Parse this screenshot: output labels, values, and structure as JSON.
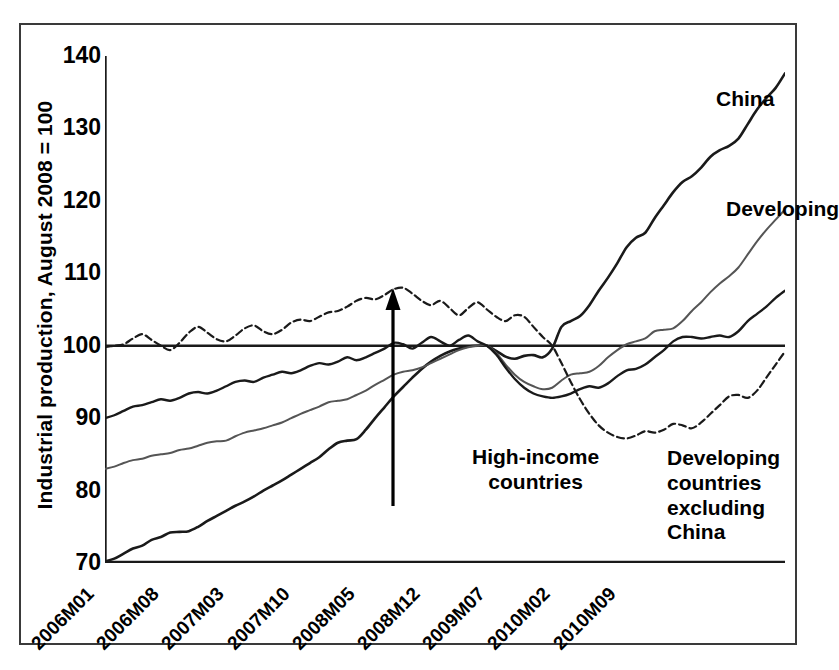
{
  "chart_data": {
    "type": "line",
    "title": "",
    "subtitle": "",
    "xlabel": "",
    "ylabel": "Industrial production, August 2008 = 100",
    "ylim": [
      70,
      140
    ],
    "ytick_values": [
      70,
      80,
      90,
      100,
      110,
      120,
      130,
      140
    ],
    "ytick_labels": [
      "70",
      "80",
      "90",
      "100",
      "110",
      "120",
      "130",
      "140"
    ],
    "grid": false,
    "legend_position": "inline-annotations",
    "reference_line": 100,
    "x_tick_labels": [
      "2006M01",
      "2006M08",
      "2007M03",
      "2007M10",
      "2008M05",
      "2008M12",
      "2009M07",
      "2010M02",
      "2010M09"
    ],
    "x_tick_indices": [
      0,
      7,
      14,
      21,
      28,
      35,
      42,
      49,
      56
    ],
    "x_count": 61,
    "annotations": [
      {
        "name": "china",
        "text": "China"
      },
      {
        "name": "developing",
        "text": "Developing"
      },
      {
        "name": "high-income",
        "text": "High-income\ncountries"
      },
      {
        "name": "developing-excluding-china",
        "text": "Developing\ncountries\nexcluding\nChina"
      }
    ],
    "series": [
      {
        "name": "China",
        "style": "solid",
        "color": "#1a1a1a",
        "width": 2.6,
        "values": [
          70.2,
          70.6,
          71.3,
          72.0,
          72.4,
          73.2,
          73.6,
          74.2,
          74.3,
          74.4,
          75.0,
          75.8,
          76.5,
          77.2,
          77.9,
          78.5,
          79.2,
          80.0,
          80.7,
          81.4,
          82.2,
          83.0,
          83.8,
          84.6,
          85.7,
          86.6,
          86.9,
          87.1,
          88.4,
          90.0,
          91.5,
          93.0,
          94.3,
          95.6,
          96.8,
          97.8,
          98.6,
          99.2,
          99.6,
          99.9,
          100.0,
          100.0,
          99.3,
          98.5,
          98.2,
          98.6,
          98.7,
          98.4,
          99.6,
          102.6,
          103.4,
          104.1,
          105.6,
          107.6,
          109.4,
          111.4,
          113.6,
          114.9,
          115.6,
          117.6,
          119.4,
          121.2,
          122.6,
          123.4,
          124.6,
          126.1,
          127.0,
          127.6,
          128.6,
          130.6,
          132.6,
          134.2,
          135.6,
          137.6
        ],
        "end_value": 137.6,
        "start_value": 70.2
      },
      {
        "name": "Developing",
        "style": "solid-thin",
        "color": "#555555",
        "width": 2.0,
        "values": [
          83.0,
          83.3,
          83.8,
          84.2,
          84.4,
          84.8,
          85.0,
          85.2,
          85.6,
          85.8,
          86.2,
          86.6,
          86.8,
          86.9,
          87.5,
          88.0,
          88.3,
          88.6,
          89.0,
          89.4,
          90.0,
          90.6,
          91.1,
          91.6,
          92.2,
          92.4,
          92.6,
          93.2,
          93.8,
          94.6,
          95.3,
          96.0,
          96.4,
          96.6,
          97.0,
          97.6,
          98.2,
          98.8,
          99.4,
          99.8,
          100.0,
          100.0,
          99.0,
          97.4,
          96.0,
          95.0,
          94.4,
          94.0,
          94.2,
          95.2,
          96.0,
          96.2,
          96.4,
          97.2,
          98.4,
          99.4,
          100.2,
          100.6,
          101.0,
          102.0,
          102.2,
          102.4,
          103.4,
          104.8,
          106.0,
          107.4,
          108.6,
          109.6,
          110.8,
          112.6,
          114.4,
          116.0,
          117.4,
          118.8
        ],
        "end_value": 118.8,
        "start_value": 83.0
      },
      {
        "name": "Developing countries excluding China",
        "style": "solid-mid",
        "color": "#1a1a1a",
        "width": 2.4,
        "values": [
          90.0,
          90.4,
          91.0,
          91.6,
          91.8,
          92.2,
          92.6,
          92.4,
          92.8,
          93.4,
          93.6,
          93.4,
          93.8,
          94.4,
          95.0,
          95.2,
          95.0,
          95.6,
          96.0,
          96.4,
          96.2,
          96.6,
          97.2,
          97.6,
          97.4,
          97.8,
          98.4,
          98.0,
          98.4,
          99.0,
          99.6,
          100.4,
          100.2,
          99.6,
          100.4,
          101.2,
          100.6,
          100.0,
          100.8,
          101.4,
          100.6,
          100.0,
          98.8,
          97.0,
          95.4,
          94.2,
          93.4,
          93.0,
          92.8,
          93.0,
          93.4,
          94.0,
          94.4,
          94.2,
          94.8,
          95.8,
          96.6,
          96.8,
          97.4,
          98.4,
          99.4,
          100.6,
          101.2,
          101.2,
          101.0,
          101.2,
          101.4,
          101.2,
          102.0,
          103.4,
          104.4,
          105.4,
          106.6,
          107.6
        ],
        "end_value": 107.6,
        "start_value": 90.0
      },
      {
        "name": "High-income countries",
        "style": "dashed",
        "color": "#1a1a1a",
        "width": 2.2,
        "values": [
          99.8,
          100.0,
          100.2,
          101.0,
          101.6,
          100.8,
          100.0,
          99.4,
          100.4,
          101.8,
          102.6,
          101.8,
          100.9,
          100.6,
          101.4,
          102.4,
          102.8,
          102.0,
          101.6,
          102.2,
          103.2,
          103.6,
          103.4,
          104.0,
          104.6,
          104.8,
          105.4,
          106.2,
          106.6,
          106.4,
          107.0,
          107.8,
          108.0,
          107.2,
          106.2,
          105.6,
          106.2,
          105.2,
          104.2,
          105.2,
          106.0,
          105.0,
          104.0,
          103.4,
          104.2,
          104.0,
          102.6,
          101.2,
          100.0,
          97.6,
          95.0,
          92.6,
          90.6,
          89.0,
          88.0,
          87.4,
          87.2,
          87.6,
          88.2,
          88.0,
          88.4,
          89.2,
          89.0,
          88.6,
          89.4,
          90.6,
          91.8,
          93.0,
          93.2,
          92.8,
          93.8,
          95.6,
          97.4,
          99.2
        ],
        "end_value": 99.2,
        "start_value": 99.8
      }
    ]
  }
}
